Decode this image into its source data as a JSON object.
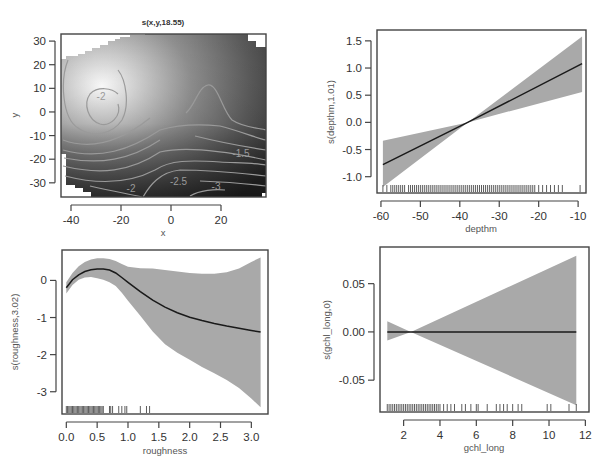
{
  "chart_data": [
    {
      "id": "xy",
      "type": "heatmap",
      "title": "s(x,y,18.55)",
      "xlabel": "x",
      "ylabel": "y",
      "xlim": [
        -44,
        38
      ],
      "ylim": [
        -36,
        33
      ],
      "xticks": [
        -40,
        -20,
        0,
        20
      ],
      "yticks": [
        -30,
        -20,
        -10,
        0,
        10,
        20,
        30
      ],
      "peak": {
        "x": -29,
        "y": 1
      },
      "contour_labels": [
        {
          "text": "-2",
          "x": -28,
          "y": 5
        },
        {
          "text": "-1.5",
          "x": 28,
          "y": -19
        },
        {
          "text": "-2",
          "x": -16,
          "y": -34
        },
        {
          "text": "-2.5",
          "x": 3,
          "y": -31
        },
        {
          "text": "-3",
          "x": 18,
          "y": -33
        }
      ]
    },
    {
      "id": "depthm",
      "type": "line",
      "title": "",
      "xlabel": "depthm",
      "ylabel": "s(depthm,1.01)",
      "xlim": [
        -61,
        -8
      ],
      "ylim": [
        -1.3,
        1.7
      ],
      "xticks": [
        -60,
        -50,
        -40,
        -30,
        -20,
        -10
      ],
      "yticks": [
        -1.0,
        -0.5,
        0.0,
        0.5,
        1.0,
        1.5
      ],
      "x": [
        -59.5,
        -38,
        -9
      ],
      "fit": [
        -0.78,
        0.0,
        1.08
      ],
      "upper": [
        -0.34,
        0.0,
        1.58
      ],
      "lower": [
        -1.19,
        0.0,
        0.56
      ],
      "rug": [
        -59.5,
        -58.5,
        -57.5,
        -57,
        -56.5,
        -56,
        -55.5,
        -55,
        -54.5,
        -54,
        -53,
        -52.5,
        -52,
        -51.5,
        -51,
        -50.5,
        -50,
        -49.5,
        -49,
        -48.5,
        -48,
        -47.5,
        -47,
        -46.5,
        -46,
        -45.5,
        -45,
        -44.5,
        -44,
        -43.5,
        -43,
        -42.5,
        -42,
        -41.5,
        -41,
        -40.5,
        -40,
        -39.5,
        -39,
        -38.5,
        -38,
        -37.5,
        -37,
        -36.5,
        -36,
        -35.5,
        -35,
        -34.5,
        -34,
        -33.5,
        -33,
        -32.5,
        -32,
        -31.5,
        -31,
        -30.5,
        -30,
        -29.5,
        -29,
        -28.5,
        -28,
        -27.5,
        -27,
        -26.5,
        -26,
        -25.5,
        -25,
        -24.5,
        -24,
        -23.5,
        -23,
        -22.5,
        -22,
        -21.5,
        -21,
        -20,
        -19,
        -18,
        -17,
        -16,
        -15,
        -14,
        -9.5
      ]
    },
    {
      "id": "roughness",
      "type": "line",
      "title": "",
      "xlabel": "roughness",
      "ylabel": "s(roughness,3.02)",
      "xlim": [
        -0.07,
        3.27
      ],
      "ylim": [
        -3.6,
        0.82
      ],
      "xticks": [
        0.0,
        0.5,
        1.0,
        1.5,
        2.0,
        2.5,
        3.0
      ],
      "xtick_labels": [
        "0.0",
        "0.5",
        "1.0",
        "1.5",
        "2.0",
        "2.5",
        "3.0"
      ],
      "yticks": [
        -3,
        -2,
        -1,
        0
      ],
      "x": [
        0.0,
        0.1,
        0.2,
        0.3,
        0.4,
        0.5,
        0.6,
        0.7,
        0.8,
        0.9,
        1.0,
        1.2,
        1.4,
        1.6,
        1.8,
        2.0,
        2.2,
        2.4,
        2.6,
        2.8,
        3.0,
        3.15
      ],
      "fit": [
        -0.2,
        0.02,
        0.15,
        0.24,
        0.29,
        0.31,
        0.31,
        0.28,
        0.2,
        0.08,
        -0.05,
        -0.3,
        -0.53,
        -0.72,
        -0.87,
        -0.99,
        -1.08,
        -1.16,
        -1.23,
        -1.29,
        -1.35,
        -1.39
      ],
      "upper": [
        -0.05,
        0.2,
        0.38,
        0.5,
        0.56,
        0.6,
        0.6,
        0.58,
        0.52,
        0.44,
        0.37,
        0.33,
        0.32,
        0.28,
        0.24,
        0.2,
        0.18,
        0.18,
        0.22,
        0.32,
        0.5,
        0.62
      ],
      "lower": [
        -0.35,
        -0.12,
        0.02,
        0.08,
        0.09,
        0.06,
        0.02,
        -0.05,
        -0.15,
        -0.33,
        -0.55,
        -0.95,
        -1.38,
        -1.72,
        -1.95,
        -2.14,
        -2.33,
        -2.5,
        -2.68,
        -2.9,
        -3.18,
        -3.42
      ],
      "rug": [
        0.0,
        0.02,
        0.04,
        0.06,
        0.08,
        0.1,
        0.12,
        0.14,
        0.16,
        0.18,
        0.2,
        0.22,
        0.24,
        0.26,
        0.28,
        0.3,
        0.32,
        0.34,
        0.36,
        0.38,
        0.4,
        0.42,
        0.44,
        0.46,
        0.48,
        0.5,
        0.52,
        0.54,
        0.56,
        0.58,
        0.6,
        0.7,
        0.72,
        0.75,
        0.85,
        0.9,
        0.95,
        0.98,
        1.2,
        1.3,
        1.35
      ]
    },
    {
      "id": "gchl_long",
      "type": "line",
      "title": "",
      "xlabel": "gchl_long",
      "ylabel": "s(gchl_long,0)",
      "xlim": [
        0.7,
        12.2
      ],
      "ylim": [
        -0.083,
        0.088
      ],
      "xticks": [
        2,
        4,
        6,
        8,
        10,
        12
      ],
      "yticks": [
        -0.05,
        0.0,
        0.05
      ],
      "ytick_labels": [
        "-0.05",
        "0.00",
        "0.05"
      ],
      "x": [
        1.1,
        2.4,
        11.5
      ],
      "fit": [
        0.0,
        0.0,
        0.0
      ],
      "upper": [
        0.011,
        0.0,
        0.079
      ],
      "lower": [
        -0.009,
        0.0,
        -0.076
      ],
      "rug": [
        1.1,
        1.2,
        1.3,
        1.4,
        1.5,
        1.6,
        1.7,
        1.8,
        1.9,
        2.0,
        2.1,
        2.2,
        2.3,
        2.4,
        2.5,
        2.6,
        2.7,
        2.8,
        2.9,
        3.0,
        3.1,
        3.2,
        3.3,
        3.4,
        3.5,
        3.6,
        3.7,
        3.8,
        3.9,
        4.0,
        4.2,
        4.4,
        4.6,
        4.8,
        5.2,
        5.4,
        5.7,
        6.0,
        6.1,
        6.6,
        7.1,
        7.3,
        7.5,
        7.7,
        8.0,
        8.3,
        8.5,
        9.9,
        10.1,
        11.1,
        11.5
      ]
    }
  ]
}
